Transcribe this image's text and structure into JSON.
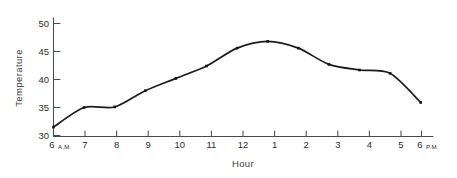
{
  "chart_data": {
    "type": "line",
    "title": "",
    "xlabel": "Hour",
    "ylabel": "Temperature",
    "categories": [
      "6 A.M.",
      "7",
      "8",
      "9",
      "10",
      "11",
      "12",
      "1",
      "2",
      "3",
      "4",
      "5",
      "6 P.M."
    ],
    "x": [
      6,
      7,
      8,
      9,
      10,
      11,
      12,
      13,
      14,
      15,
      16,
      17,
      18
    ],
    "values": [
      31.5,
      35.0,
      35.1,
      38.0,
      40.2,
      42.4,
      45.6,
      46.8,
      45.6,
      42.7,
      41.7,
      41.1,
      35.9
    ],
    "series": [
      {
        "name": "Temperature",
        "values": [
          31.5,
          35.0,
          35.1,
          38.0,
          40.2,
          42.4,
          45.6,
          46.8,
          45.6,
          42.7,
          41.7,
          41.1,
          35.9
        ]
      }
    ],
    "ylim": [
      30,
      51
    ],
    "yticks": [
      30,
      35,
      40,
      45,
      50
    ],
    "ytick_labels": [
      "30",
      "35",
      "40",
      "45",
      "50"
    ],
    "xtick_labels": [
      "6",
      "7",
      "8",
      "9",
      "10",
      "11",
      "12",
      "1",
      "2",
      "3",
      "4",
      "5",
      "6"
    ],
    "first_tick_suffix": "A.M.",
    "last_tick_suffix": "P.M.",
    "grid": false,
    "legend": false,
    "legend_position": "none",
    "marker": "dot",
    "line_color": "#1c1c1c",
    "axis_color": "#4a4a4a",
    "background_color": "#ffffff"
  },
  "axes": {
    "y_axis_title": "Temperature",
    "x_axis_title": "Hour"
  }
}
